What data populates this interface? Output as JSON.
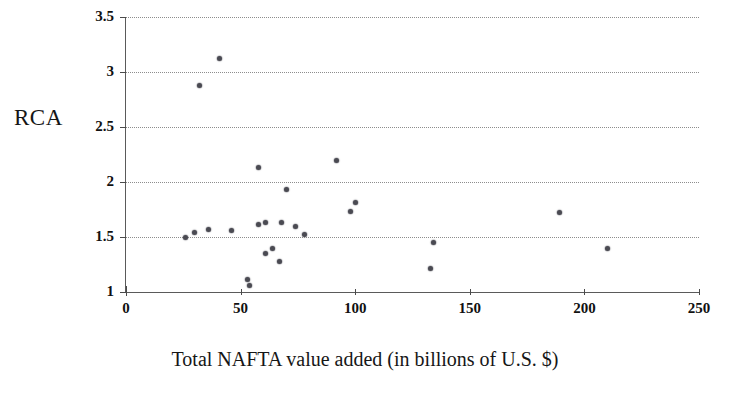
{
  "chart_data": {
    "type": "scatter",
    "title": "",
    "xlabel": "Total NAFTA value added (in billions of U.S. $)",
    "ylabel": "RCA",
    "xlim": [
      0,
      250
    ],
    "ylim": [
      1,
      3.5
    ],
    "xticks": [
      0,
      50,
      100,
      150,
      200,
      250
    ],
    "yticks": [
      1,
      1.5,
      2,
      2.5,
      3,
      3.5
    ],
    "xtick_labels": [
      "0",
      "50",
      "100",
      "150",
      "200",
      "250"
    ],
    "ytick_labels": [
      "1",
      "1.5",
      "2",
      "2.5",
      "3",
      "3.5"
    ],
    "grid": "horizontal dotted gridlines at each y tick",
    "legend": "none",
    "marker_color": "#4a4a52",
    "points": [
      {
        "x": 26,
        "y": 1.5
      },
      {
        "x": 30,
        "y": 1.54
      },
      {
        "x": 32,
        "y": 2.88
      },
      {
        "x": 36,
        "y": 1.57
      },
      {
        "x": 41,
        "y": 3.12
      },
      {
        "x": 46,
        "y": 1.56
      },
      {
        "x": 53,
        "y": 1.11
      },
      {
        "x": 54,
        "y": 1.06
      },
      {
        "x": 58,
        "y": 2.13
      },
      {
        "x": 58,
        "y": 1.61
      },
      {
        "x": 61,
        "y": 1.63
      },
      {
        "x": 61,
        "y": 1.35
      },
      {
        "x": 64,
        "y": 1.4
      },
      {
        "x": 67,
        "y": 1.28
      },
      {
        "x": 68,
        "y": 1.63
      },
      {
        "x": 70,
        "y": 1.93
      },
      {
        "x": 74,
        "y": 1.6
      },
      {
        "x": 78,
        "y": 1.52
      },
      {
        "x": 92,
        "y": 2.2
      },
      {
        "x": 98,
        "y": 1.73
      },
      {
        "x": 100,
        "y": 1.81
      },
      {
        "x": 134,
        "y": 1.45
      },
      {
        "x": 133,
        "y": 1.21
      },
      {
        "x": 189,
        "y": 1.72
      },
      {
        "x": 210,
        "y": 1.4
      }
    ]
  },
  "axes": {
    "y_title": "RCA",
    "x_title": "Total NAFTA value added (in billions of U.S. $)"
  }
}
